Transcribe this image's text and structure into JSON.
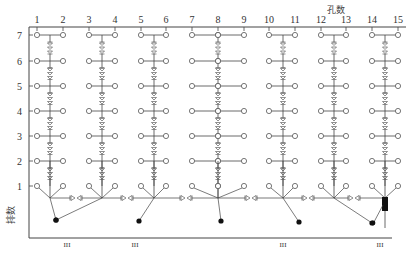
{
  "x_axis": {
    "label": "孔数",
    "ticks": [
      "1",
      "2",
      "3",
      "4",
      "5",
      "6",
      "7",
      "8",
      "9",
      "10",
      "11",
      "12",
      "13",
      "14",
      "15"
    ],
    "tick_x": [
      37,
      63,
      89,
      115,
      141,
      166,
      192,
      218,
      244,
      269,
      295,
      321,
      346,
      372,
      398
    ]
  },
  "y_axis": {
    "label": "排数",
    "ticks": [
      "7",
      "6",
      "5",
      "4",
      "3",
      "2",
      "1"
    ],
    "tick_y": [
      35,
      61,
      86,
      111,
      136,
      161,
      186
    ]
  },
  "groups": [
    {
      "holes": [
        1,
        2
      ],
      "trunk_x": 50,
      "hub_y": 198,
      "tail": [
        56,
        220
      ]
    },
    {
      "holes": [
        3,
        4
      ],
      "trunk_x": 102,
      "hub_y": 198,
      "tail": [
        56,
        220
      ]
    },
    {
      "holes": [
        5,
        6
      ],
      "trunk_x": 154,
      "hub_y": 198,
      "tail": [
        139,
        221
      ]
    },
    {
      "holes": [
        7,
        8,
        9
      ],
      "trunk_x": 218,
      "hub_y": 198,
      "tail": [
        221,
        221
      ]
    },
    {
      "holes": [
        10,
        11
      ],
      "trunk_x": 283,
      "hub_y": 198,
      "tail": [
        299,
        222
      ]
    },
    {
      "holes": [
        12,
        13
      ],
      "trunk_x": 334,
      "hub_y": 198,
      "tail": [
        372,
        223
      ]
    },
    {
      "holes": [
        14,
        15
      ],
      "trunk_x": 385,
      "hub_y": 198,
      "tail": null
    }
  ],
  "connector_delays": [
    {
      "x": 76,
      "y": 198
    },
    {
      "x": 127,
      "y": 198
    },
    {
      "x": 186,
      "y": 198
    },
    {
      "x": 251,
      "y": 198
    },
    {
      "x": 308,
      "y": 198
    },
    {
      "x": 354,
      "y": 198
    }
  ],
  "bottom_marks": [
    {
      "x": 67,
      "label": "III"
    },
    {
      "x": 135,
      "label": "III"
    },
    {
      "x": 283,
      "label": "III"
    },
    {
      "x": 380,
      "label": "III"
    }
  ],
  "colors": {
    "line": "#444444",
    "hole": "#555555",
    "fill": "#111111"
  }
}
